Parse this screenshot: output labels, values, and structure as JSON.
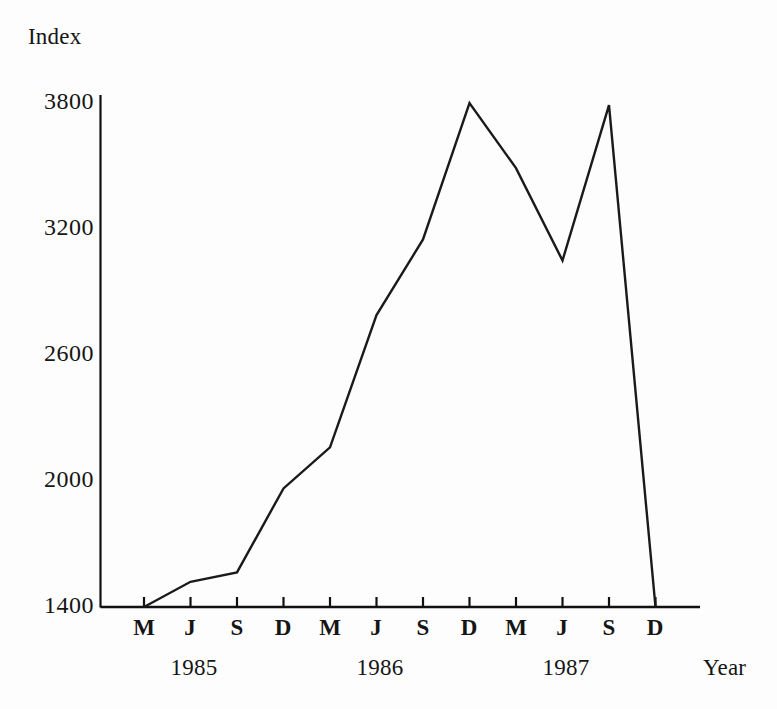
{
  "chart_data": {
    "type": "line",
    "title": "",
    "ylabel": "Index",
    "xlabel": "Year",
    "ylim": [
      1400,
      3800
    ],
    "yticks": [
      1400,
      2000,
      2600,
      3200,
      3800
    ],
    "ytick_labels": [
      "1400",
      "2000",
      "2600",
      "3200",
      "3800"
    ],
    "grid": false,
    "legend": "none",
    "categories": [
      "M",
      "J",
      "S",
      "D",
      "M",
      "J",
      "S",
      "D",
      "M",
      "J",
      "S",
      "D"
    ],
    "x_group_labels": [
      "1985",
      "1986",
      "1987"
    ],
    "values": [
      1400,
      1520,
      1565,
      1965,
      2160,
      2790,
      3150,
      3800,
      3490,
      3050,
      3790,
      1400
    ],
    "series": [
      {
        "name": "Index",
        "color": "#1a1a1a",
        "values": [
          1400,
          1520,
          1565,
          1965,
          2160,
          2790,
          3150,
          3800,
          3490,
          3050,
          3790,
          1400
        ],
        "points": [
          {
            "x": "M",
            "year": "1985",
            "y": 1400
          },
          {
            "x": "J",
            "year": "1985",
            "y": 1520
          },
          {
            "x": "S",
            "year": "1985",
            "y": 1565
          },
          {
            "x": "D",
            "year": "1985",
            "y": 1965
          },
          {
            "x": "M",
            "year": "1986",
            "y": 2160
          },
          {
            "x": "J",
            "year": "1986",
            "y": 2790
          },
          {
            "x": "S",
            "year": "1986",
            "y": 3150
          },
          {
            "x": "D",
            "year": "1986",
            "y": 3800
          },
          {
            "x": "M",
            "year": "1987",
            "y": 3490
          },
          {
            "x": "J",
            "year": "1987",
            "y": 3050
          },
          {
            "x": "S",
            "year": "1987",
            "y": 3790
          },
          {
            "x": "D",
            "year": "1987",
            "y": 1400
          }
        ]
      }
    ]
  },
  "axis": {
    "y_title": "Index",
    "x_title": "Year"
  },
  "ytick_labels": [
    "3800",
    "3200",
    "2600",
    "2000",
    "1400"
  ],
  "xtick_labels": [
    "M",
    "J",
    "S",
    "D",
    "M",
    "J",
    "S",
    "D",
    "M",
    "J",
    "S",
    "D"
  ],
  "year_labels": [
    "1985",
    "1986",
    "1987"
  ],
  "colors": {
    "line": "#1a1a1a",
    "axis": "#111111",
    "background": "#fdfdfd",
    "text": "#151515"
  }
}
